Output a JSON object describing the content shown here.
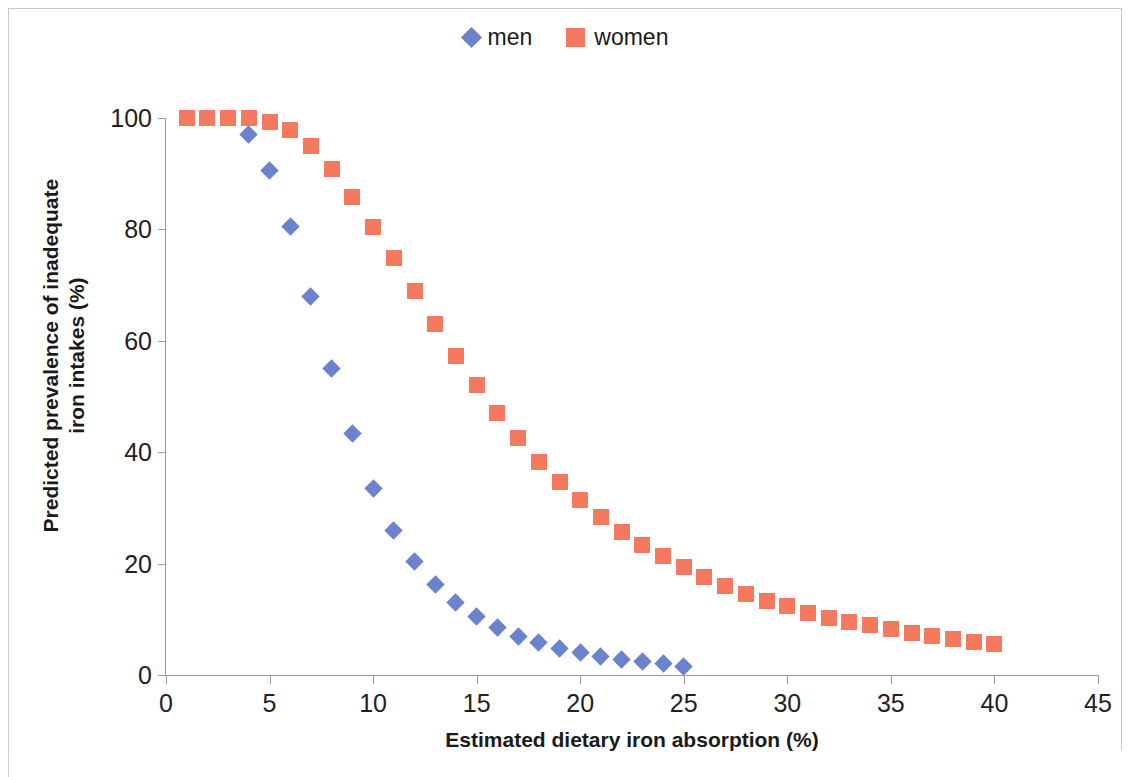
{
  "chart_data": {
    "type": "scatter",
    "title": "",
    "xlabel": "Estimated dietary iron absorption (%)",
    "ylabel_line1": "Predicted prevalence of inadequate",
    "ylabel_line2": "iron intakes (%)",
    "xlim": [
      0,
      45
    ],
    "ylim": [
      0,
      100
    ],
    "xticks": [
      0,
      5,
      10,
      15,
      20,
      25,
      30,
      35,
      40,
      45
    ],
    "yticks": [
      0,
      20,
      40,
      60,
      80,
      100
    ],
    "grid": false,
    "legend_position": "top-center",
    "series": [
      {
        "name": "men",
        "marker": "diamond",
        "color": "#6B82CE",
        "x": [
          4,
          5,
          6,
          7,
          8,
          9,
          10,
          11,
          12,
          13,
          14,
          15,
          16,
          17,
          18,
          19,
          20,
          21,
          22,
          23,
          24,
          25
        ],
        "values": [
          97.0,
          90.5,
          80.5,
          68.0,
          55.0,
          43.3,
          33.5,
          26.0,
          20.4,
          16.2,
          13.0,
          10.5,
          8.6,
          7.0,
          5.8,
          4.8,
          4.0,
          3.4,
          2.8,
          2.4,
          2.0,
          1.6
        ]
      },
      {
        "name": "women",
        "marker": "square",
        "color": "#F4795E",
        "x": [
          1,
          2,
          3,
          4,
          5,
          6,
          7,
          8,
          9,
          10,
          11,
          12,
          13,
          14,
          15,
          16,
          17,
          18,
          19,
          20,
          21,
          22,
          23,
          24,
          25,
          26,
          27,
          28,
          29,
          30,
          31,
          32,
          33,
          34,
          35,
          36,
          37,
          38,
          39,
          40
        ],
        "values": [
          100.0,
          100.0,
          100.0,
          100.0,
          99.2,
          97.8,
          95.0,
          90.8,
          85.8,
          80.5,
          74.8,
          68.9,
          63.0,
          57.2,
          52.0,
          47.0,
          42.5,
          38.2,
          34.6,
          31.5,
          28.3,
          25.7,
          23.4,
          21.3,
          19.4,
          17.6,
          16.0,
          14.5,
          13.3,
          12.3,
          11.2,
          10.2,
          9.6,
          8.9,
          8.3,
          7.6,
          7.0,
          6.5,
          6.0,
          5.5
        ]
      }
    ]
  },
  "legend": {
    "items": [
      {
        "label": "men",
        "marker": "diamond",
        "color": "#6B82CE"
      },
      {
        "label": "women",
        "marker": "square",
        "color": "#F4795E"
      }
    ]
  },
  "colors": {
    "men": "#6B82CE",
    "women": "#F4795E",
    "axis": "#9a9a9a",
    "text": "#1a1a1a",
    "frame": "#c8c8c8",
    "background": "#ffffff"
  }
}
